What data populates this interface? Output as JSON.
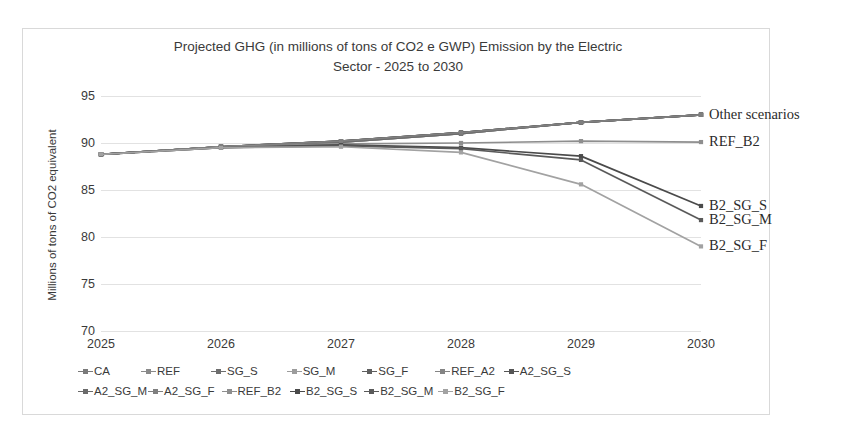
{
  "chart_data": {
    "type": "line",
    "title": "Projected GHG (in millions of tons of CO2 e GWP) Emission by the Electric Sector - 2025 to 2030",
    "title_lines": [
      "Projected GHG (in millions of tons of CO2 e GWP) Emission by the Electric",
      "Sector - 2025 to 2030"
    ],
    "xlabel": "",
    "ylabel": "Millions of tons of CO2 equivalent",
    "categories": [
      2025,
      2026,
      2027,
      2028,
      2029,
      2030
    ],
    "x_tick_labels": [
      "2025",
      "2026",
      "2027",
      "2028",
      "2029",
      "2030"
    ],
    "y_tick_labels": [
      "95",
      "90",
      "85",
      "80",
      "75",
      "70"
    ],
    "y_ticks": [
      95,
      90,
      85,
      80,
      75,
      70
    ],
    "ylim": [
      70,
      95
    ],
    "grid": true,
    "legend_position": "bottom",
    "series": [
      {
        "name": "CA",
        "values": [
          88.8,
          89.6,
          90.1,
          91.0,
          92.2,
          93.0
        ],
        "color": "#7a7a7a"
      },
      {
        "name": "REF",
        "values": [
          88.8,
          89.6,
          90.2,
          91.1,
          92.2,
          93.0
        ],
        "color": "#8a8a8a"
      },
      {
        "name": "SG_S",
        "values": [
          88.8,
          89.6,
          90.2,
          91.1,
          92.2,
          93.0
        ],
        "color": "#6e6e6e"
      },
      {
        "name": "SG_M",
        "values": [
          88.8,
          89.6,
          90.1,
          91.0,
          92.2,
          93.0
        ],
        "color": "#9c9c9c"
      },
      {
        "name": "SG_F",
        "values": [
          88.8,
          89.6,
          90.2,
          91.1,
          92.2,
          93.0
        ],
        "color": "#5f5f5f"
      },
      {
        "name": "REF_A2",
        "values": [
          88.8,
          89.6,
          90.1,
          91.0,
          92.2,
          93.0
        ],
        "color": "#848484"
      },
      {
        "name": "A2_SG_S",
        "values": [
          88.8,
          89.6,
          90.2,
          91.1,
          92.2,
          93.0
        ],
        "color": "#555555"
      },
      {
        "name": "A2_SG_M",
        "values": [
          88.8,
          89.6,
          90.1,
          91.0,
          92.2,
          93.0
        ],
        "color": "#6a6a6a"
      },
      {
        "name": "A2_SG_F",
        "values": [
          88.8,
          89.6,
          90.2,
          91.1,
          92.2,
          93.0
        ],
        "color": "#7f7f7f"
      },
      {
        "name": "REF_B2",
        "values": [
          88.8,
          89.6,
          89.9,
          90.0,
          90.2,
          90.1
        ],
        "color": "#8e8e8e"
      },
      {
        "name": "B2_SG_S",
        "values": [
          88.8,
          89.5,
          89.8,
          89.5,
          88.6,
          83.3
        ],
        "color": "#4a4a4a"
      },
      {
        "name": "B2_SG_M",
        "values": [
          88.8,
          89.5,
          89.7,
          89.4,
          88.2,
          81.8
        ],
        "color": "#5a5a5a"
      },
      {
        "name": "B2_SG_F",
        "values": [
          88.8,
          89.5,
          89.6,
          89.0,
          85.6,
          79.0
        ],
        "color": "#a2a2a2"
      }
    ],
    "annotations": [
      {
        "text": "Other scenarios",
        "value": 93.0,
        "at_year": 2030
      },
      {
        "text": "REF_B2",
        "value": 90.1,
        "at_year": 2030
      },
      {
        "text": "B2_SG_S",
        "value": 83.3,
        "at_year": 2030
      },
      {
        "text": "B2_SG_M",
        "value": 81.8,
        "at_year": 2030
      },
      {
        "text": "B2_SG_F",
        "value": 79.0,
        "at_year": 2030
      }
    ],
    "legend": [
      {
        "label": "CA",
        "color": "#7a7a7a"
      },
      {
        "label": "REF",
        "color": "#8a8a8a"
      },
      {
        "label": "SG_S",
        "color": "#6e6e6e"
      },
      {
        "label": "SG_M",
        "color": "#9c9c9c"
      },
      {
        "label": "SG_F",
        "color": "#5f5f5f"
      },
      {
        "label": "REF_A2",
        "color": "#848484"
      },
      {
        "label": "A2_SG_S",
        "color": "#555555"
      },
      {
        "label": "A2_SG_M",
        "color": "#6a6a6a"
      },
      {
        "label": "A2_SG_F",
        "color": "#7f7f7f"
      },
      {
        "label": "REF_B2",
        "color": "#8e8e8e"
      },
      {
        "label": "B2_SG_S",
        "color": "#4a4a4a"
      },
      {
        "label": "B2_SG_M",
        "color": "#5a5a5a"
      },
      {
        "label": "B2_SG_F",
        "color": "#a2a2a2"
      }
    ],
    "legend_rows": [
      [
        "CA",
        "REF",
        "SG_S",
        "SG_M",
        "SG_F",
        "REF_A2",
        "A2_SG_S"
      ],
      [
        "A2_SG_M",
        "A2_SG_F",
        "REF_B2",
        "B2_SG_S",
        "B2_SG_M",
        "B2_SG_F"
      ]
    ]
  }
}
